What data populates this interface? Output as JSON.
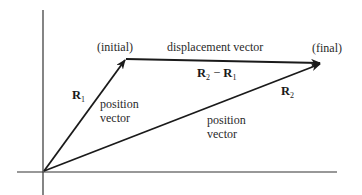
{
  "diagram": {
    "type": "vector-displacement",
    "labels": {
      "initial": "(initial)",
      "final": "(final)",
      "displacement": "displacement vector",
      "displacement_expr_a": "R",
      "displacement_expr_a_sub": "2",
      "displacement_expr_op": " − ",
      "displacement_expr_b": "R",
      "displacement_expr_b_sub": "1",
      "r1": "R",
      "r1_sub": "1",
      "r2": "R",
      "r2_sub": "2",
      "position_vector_1_line1": "position",
      "position_vector_1_line2": "vector",
      "position_vector_2_line1": "position",
      "position_vector_2_line2": "vector"
    },
    "points": {
      "origin": [
        44,
        171
      ],
      "initial": [
        126,
        59
      ],
      "final": [
        321,
        63
      ]
    },
    "colors": {
      "line": "#1a1a1a",
      "axis": "#333333",
      "text": "#2a2a2a"
    }
  }
}
